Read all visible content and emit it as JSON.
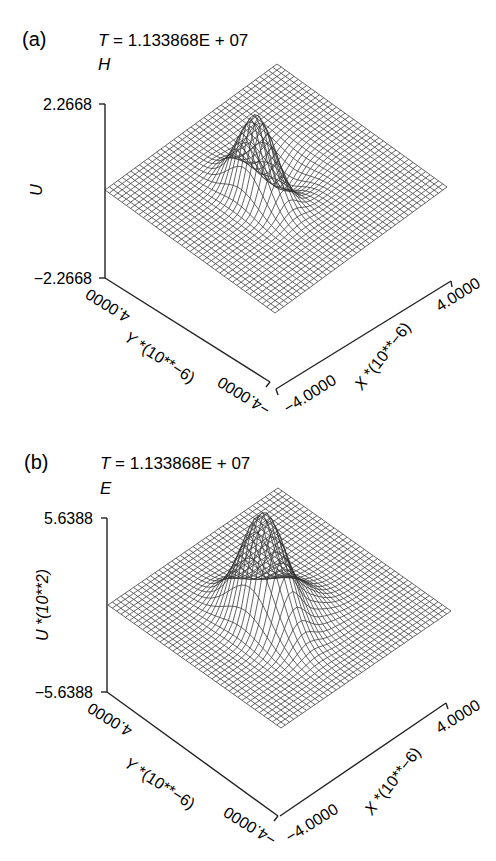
{
  "chart_data": [
    {
      "type": "surface-3d-wireframe",
      "panel_label": "(a)",
      "title": "T = 1.133868E + 07",
      "title_var": "T",
      "title_value": "= 1.133868E + 07",
      "field_label": "H",
      "zlabel": "U",
      "zlim": [
        -2.2668,
        2.2668
      ],
      "z_ticks": [
        "2.2668",
        "-2.2668"
      ],
      "xlabel": "X *(10**-6)",
      "ylabel": "Y *(10**-6)",
      "x_ticks": [
        "-4.0000",
        "4.0000"
      ],
      "y_ticks": [
        "4.0000",
        "-4.0000"
      ],
      "xlim": [
        -4.0,
        4.0
      ],
      "ylim": [
        -4.0,
        4.0
      ],
      "grid_resolution": 40,
      "surface": {
        "description": "Flat plane with a single localized pulse (Gaussian-like peak with adjacent trough) near the center",
        "peak_value": 2.2668,
        "trough_value": -2.2668,
        "peak_location_xy": [
          0.0,
          0.5
        ]
      }
    },
    {
      "type": "surface-3d-wireframe",
      "panel_label": "(b)",
      "title": "T = 1.133868E + 07",
      "title_var": "T",
      "title_value": "= 1.133868E + 07",
      "field_label": "E",
      "zlabel": "U *(10**2)",
      "zlim": [
        -5.6388,
        5.6388
      ],
      "z_ticks": [
        "5.6388",
        "-5.6388"
      ],
      "xlabel": "X *(10**-6)",
      "ylabel": "Y *(10**-6)",
      "x_ticks": [
        "-4.0000",
        "4.0000"
      ],
      "y_ticks": [
        "4.0000",
        "-4.0000"
      ],
      "xlim": [
        -4.0,
        4.0
      ],
      "ylim": [
        -4.0,
        4.0
      ],
      "grid_resolution": 40,
      "surface": {
        "description": "Flat plane with a single localized pulse (taller peak with broad lobe and trough) near the center",
        "peak_value": 5.6388,
        "trough_value": -5.6388,
        "peak_location_xy": [
          0.0,
          0.5
        ]
      }
    }
  ],
  "panels": [
    {
      "label": "(a)",
      "title_var": "T",
      "title_value": " = 1.133868E + 07",
      "field": "H",
      "z_top": "2.2668",
      "z_bottom": "−2.2668",
      "z_label": "U",
      "y_far": "4.0000",
      "y_near": "−4.0000",
      "y_label_var": "Y",
      "y_label_rest": " *(10**−6)",
      "x_near": "−4.0000",
      "x_far": "4.0000",
      "x_label_var": "X",
      "x_label_rest": " *(10**−6)"
    },
    {
      "label": "(b)",
      "title_var": "T",
      "title_value": " = 1.133868E + 07",
      "field": "E",
      "z_top": "5.6388",
      "z_bottom": "−5.6388",
      "z_label": "U *(10**2)",
      "y_far": "4.0000",
      "y_near": "−4.0000",
      "y_label_var": "Y",
      "y_label_rest": " *(10**−6)",
      "x_near": "−4.0000",
      "x_far": "4.0000",
      "x_label_var": "X",
      "x_label_rest": " *(10**−6)"
    }
  ],
  "style": {
    "line_color": "#222222",
    "mesh_color": "#333333",
    "background": "#ffffff"
  }
}
